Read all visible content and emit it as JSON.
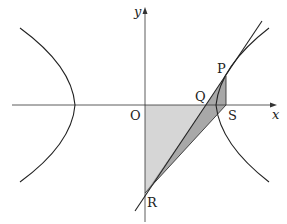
{
  "diagram": {
    "type": "hyperbola-geometry",
    "axes": {
      "x_label": "x",
      "y_label": "y",
      "origin_label": "O"
    },
    "points": [
      {
        "label": "P",
        "desc": "point on right branch of hyperbola, tangent point"
      },
      {
        "label": "Q",
        "desc": "x-intercept of tangent line"
      },
      {
        "label": "S",
        "desc": "foot of perpendicular from P on x-axis"
      },
      {
        "label": "R",
        "desc": "y-intercept of tangent line"
      },
      {
        "label": "O",
        "desc": "origin"
      }
    ],
    "shaded_regions": [
      {
        "name": "triangle OQR",
        "fill": "#d6d6d6"
      },
      {
        "name": "triangle PRS (outside OQR)",
        "fill": "#a8a8a8"
      }
    ],
    "curves": [
      "hyperbola left branch",
      "hyperbola right branch",
      "tangent line at P",
      "asymptote-like line through P"
    ],
    "colors": {
      "stroke": "#222222",
      "light_fill": "#d6d6d6",
      "dark_fill": "#a8a8a8"
    }
  }
}
